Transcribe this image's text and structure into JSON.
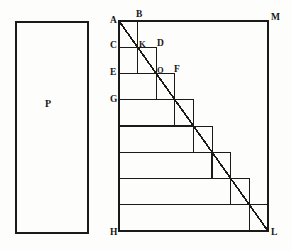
{
  "figure": {
    "ink_color": "#1a1a1a",
    "paper_color": "#fdfdfc",
    "canvas": {
      "width": 292,
      "height": 250
    }
  },
  "rectangle_p": {
    "label": "P",
    "x": 16,
    "y": 22,
    "width": 72,
    "height": 211,
    "label_x": 45,
    "label_y": 99
  },
  "main_frame": {
    "A": {
      "x": 119,
      "y": 21
    },
    "H": {
      "x": 119,
      "y": 231
    },
    "L": {
      "x": 268,
      "y": 231
    },
    "M": {
      "x": 268,
      "y": 21
    },
    "diagonal_from": "A",
    "diagonal_to": "L"
  },
  "staircase": {
    "step_count": 8,
    "step_height": 26.25,
    "step_width": 18.6,
    "left_x": 119,
    "top_y": 21,
    "bottom_y": 231,
    "right_x": 268,
    "treads_y": [
      21,
      47.25,
      73.5,
      99.75,
      126,
      152.25,
      178.5,
      204.75,
      231
    ],
    "risers_x": [
      119,
      137.6,
      156.2,
      174.8,
      193.4,
      212,
      230.6,
      249.2,
      268
    ]
  },
  "labels": [
    {
      "name": "A",
      "text": "A",
      "x": 110,
      "y": 16,
      "size": "big"
    },
    {
      "name": "B",
      "text": "B",
      "x": 136,
      "y": 10,
      "size": "big"
    },
    {
      "name": "C",
      "text": "C",
      "x": 110,
      "y": 41,
      "size": "big"
    },
    {
      "name": "K",
      "text": "K",
      "x": 139,
      "y": 40,
      "size": "normal"
    },
    {
      "name": "D",
      "text": "D",
      "x": 157,
      "y": 39,
      "size": "big"
    },
    {
      "name": "E",
      "text": "E",
      "x": 110,
      "y": 68,
      "size": "big"
    },
    {
      "name": "O",
      "text": "O",
      "x": 157,
      "y": 66,
      "size": "normal"
    },
    {
      "name": "F",
      "text": "F",
      "x": 174,
      "y": 65,
      "size": "big"
    },
    {
      "name": "G",
      "text": "G",
      "x": 110,
      "y": 95,
      "size": "big"
    },
    {
      "name": "H",
      "text": "H",
      "x": 110,
      "y": 228,
      "size": "big"
    },
    {
      "name": "L",
      "text": "L",
      "x": 271,
      "y": 228,
      "size": "big"
    },
    {
      "name": "M",
      "text": "M",
      "x": 271,
      "y": 13,
      "size": "big"
    }
  ],
  "legend": {
    "description": "Rectangle P at left; at right a square frame A-M-L-H containing an eight-step staircase with diagonal A to L. Points B, K, D, O, F mark the first inner step corners and diagonal crossings."
  }
}
